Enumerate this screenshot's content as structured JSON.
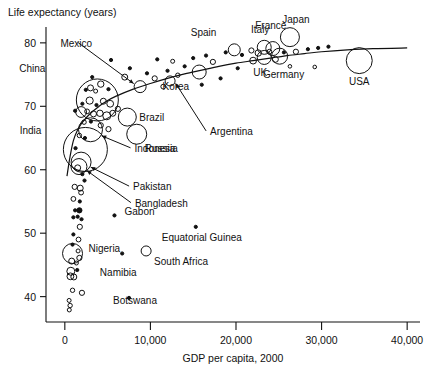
{
  "chart_data": {
    "type": "scatter",
    "title": "Life expectancy (years)",
    "xlabel": "GDP per capita, 2000",
    "ylabel": "Life expectancy (years)",
    "xlim": [
      -2200,
      41500
    ],
    "ylim": [
      36.0,
      82.5
    ],
    "xticks": [
      0,
      10000,
      20000,
      30000,
      40000
    ],
    "xticklabels": [
      "0",
      "10,000",
      "20,000",
      "30,000",
      "40,000"
    ],
    "yticks": [
      40,
      50,
      60,
      70,
      80
    ],
    "yticklabels": [
      "40",
      "50",
      "60",
      "70",
      "80"
    ],
    "grid": false,
    "legend": null,
    "bubble_note": "marker area proportional to population",
    "trend": {
      "name": "fitted-curve",
      "points": [
        [
          250,
          59.0
        ],
        [
          600,
          62.0
        ],
        [
          1000,
          64.6
        ],
        [
          1500,
          66.3
        ],
        [
          2000,
          67.4
        ],
        [
          3000,
          68.9
        ],
        [
          4000,
          70.0
        ],
        [
          5000,
          70.9
        ],
        [
          6000,
          71.6
        ],
        [
          8000,
          72.7
        ],
        [
          10000,
          73.6
        ],
        [
          12000,
          74.4
        ],
        [
          14000,
          75.1
        ],
        [
          16000,
          75.7
        ],
        [
          18000,
          76.3
        ],
        [
          20000,
          76.8
        ],
        [
          22000,
          77.2
        ],
        [
          24000,
          77.6
        ],
        [
          26000,
          78.0
        ],
        [
          28000,
          78.3
        ],
        [
          30000,
          78.6
        ],
        [
          33000,
          78.9
        ],
        [
          36000,
          79.1
        ],
        [
          40000,
          79.2
        ]
      ]
    },
    "labeled_points": [
      {
        "label": "China",
        "x": 3800,
        "y": 71.0,
        "r": 21.0,
        "filled": false,
        "label_dx": -52,
        "label_dy": -28,
        "arrow": false
      },
      {
        "label": "Mexico",
        "x": 8800,
        "y": 73.1,
        "r": 6.0,
        "filled": false,
        "label_dx": -48,
        "label_dy": -40,
        "arrow": true
      },
      {
        "label": "India",
        "x": 2400,
        "y": 63.2,
        "r": 22.0,
        "filled": false,
        "label_dx": -44,
        "label_dy": -15,
        "arrow": false
      },
      {
        "label": "Brazil",
        "x": 7300,
        "y": 68.3,
        "r": 9.0,
        "filled": false,
        "label_dx": 12,
        "label_dy": 4,
        "arrow": false
      },
      {
        "label": "Russia",
        "x": 8400,
        "y": 65.6,
        "r": 10.0,
        "filled": false,
        "label_dx": 8,
        "label_dy": 18,
        "arrow": false
      },
      {
        "label": "Indonesia",
        "x": 3000,
        "y": 66.3,
        "r": 12.0,
        "filled": false,
        "label_dx": 44,
        "label_dy": 22,
        "arrow": true
      },
      {
        "label": "Pakistan",
        "x": 1900,
        "y": 61.2,
        "r": 10.0,
        "filled": false,
        "label_dx": 52,
        "label_dy": 28,
        "arrow": true
      },
      {
        "label": "Bangladesh",
        "x": 1650,
        "y": 60.5,
        "r": 8.0,
        "filled": false,
        "label_dx": 56,
        "label_dy": 40,
        "arrow": true
      },
      {
        "label": "Nigeria",
        "x": 900,
        "y": 46.8,
        "r": 10.0,
        "filled": false,
        "label_dx": 16,
        "label_dy": -2,
        "arrow": false
      },
      {
        "label": "Argentina",
        "x": 12300,
        "y": 74.0,
        "r": 5.0,
        "filled": false,
        "label_dx": 40,
        "label_dy": 54,
        "arrow": true
      },
      {
        "label": "Korea",
        "x": 15700,
        "y": 75.4,
        "r": 7.0,
        "filled": false,
        "label_dx": -10,
        "label_dy": 18,
        "arrow": false
      },
      {
        "label": "Spain",
        "x": 19800,
        "y": 78.9,
        "r": 6.0,
        "filled": false,
        "label_dx": -18,
        "label_dy": -14,
        "arrow": false
      },
      {
        "label": "Italy",
        "x": 23300,
        "y": 79.3,
        "r": 7.0,
        "filled": false,
        "label_dx": -4,
        "label_dy": -14,
        "arrow": false
      },
      {
        "label": "France",
        "x": 24300,
        "y": 79.1,
        "r": 7.0,
        "filled": false,
        "label_dx": -2,
        "label_dy": -20,
        "arrow": false
      },
      {
        "label": "Japan",
        "x": 26300,
        "y": 80.9,
        "r": 9.5,
        "filled": false,
        "label_dx": 6,
        "label_dy": -14,
        "arrow": false
      },
      {
        "label": "UK",
        "x": 23300,
        "y": 77.7,
        "r": 7.0,
        "filled": false,
        "label_dx": -4,
        "label_dy": 18,
        "arrow": false
      },
      {
        "label": "Germany",
        "x": 25100,
        "y": 77.9,
        "r": 8.0,
        "filled": false,
        "label_dx": 4,
        "label_dy": 22,
        "arrow": false
      },
      {
        "label": "USA",
        "x": 34400,
        "y": 77.2,
        "r": 13.0,
        "filled": false,
        "label_dx": 0,
        "label_dy": 24,
        "arrow": false
      },
      {
        "label": "Gabon",
        "x": 5800,
        "y": 52.8,
        "r": 1.6,
        "filled": true,
        "label_dx": 10,
        "label_dy": 0,
        "arrow": false
      },
      {
        "label": "Equatorial Guinea",
        "x": 15300,
        "y": 51.0,
        "r": 1.6,
        "filled": true,
        "label_dx": 6,
        "label_dy": 14,
        "arrow": false
      },
      {
        "label": "South Africa",
        "x": 9500,
        "y": 47.2,
        "r": 5.0,
        "filled": false,
        "label_dx": 8,
        "label_dy": 14,
        "arrow": false
      },
      {
        "label": "Namibia",
        "x": 6700,
        "y": 46.8,
        "r": 1.6,
        "filled": true,
        "label_dx": -4,
        "label_dy": 22,
        "arrow": false
      },
      {
        "label": "Botswana",
        "x": 7500,
        "y": 39.8,
        "r": 1.6,
        "filled": true,
        "label_dx": 6,
        "label_dy": 6,
        "arrow": false
      }
    ],
    "unlabeled_points": [
      {
        "x": 5400,
        "y": 77.3,
        "r": 1.6,
        "filled": true
      },
      {
        "x": 7600,
        "y": 76.0,
        "r": 1.6,
        "filled": true
      },
      {
        "x": 3200,
        "y": 74.6,
        "r": 1.6,
        "filled": true
      },
      {
        "x": 7000,
        "y": 74.6,
        "r": 3.0,
        "filled": false
      },
      {
        "x": 4200,
        "y": 73.5,
        "r": 3.2,
        "filled": false
      },
      {
        "x": 5100,
        "y": 72.7,
        "r": 1.6,
        "filled": true
      },
      {
        "x": 3000,
        "y": 72.9,
        "r": 3.0,
        "filled": false
      },
      {
        "x": 3600,
        "y": 72.4,
        "r": 2.0,
        "filled": false
      },
      {
        "x": 2450,
        "y": 72.6,
        "r": 1.6,
        "filled": true
      },
      {
        "x": 2900,
        "y": 70.9,
        "r": 3.6,
        "filled": false
      },
      {
        "x": 2050,
        "y": 70.4,
        "r": 1.6,
        "filled": true
      },
      {
        "x": 3700,
        "y": 70.2,
        "r": 1.6,
        "filled": true
      },
      {
        "x": 4500,
        "y": 70.8,
        "r": 3.0,
        "filled": false
      },
      {
        "x": 5300,
        "y": 70.4,
        "r": 3.4,
        "filled": false
      },
      {
        "x": 1200,
        "y": 69.3,
        "r": 1.6,
        "filled": true
      },
      {
        "x": 1900,
        "y": 69.1,
        "r": 5.4,
        "filled": false
      },
      {
        "x": 2600,
        "y": 69.2,
        "r": 2.4,
        "filled": false
      },
      {
        "x": 3350,
        "y": 68.8,
        "r": 3.0,
        "filled": false
      },
      {
        "x": 4100,
        "y": 68.9,
        "r": 3.2,
        "filled": false
      },
      {
        "x": 4900,
        "y": 68.5,
        "r": 4.0,
        "filled": false
      },
      {
        "x": 5600,
        "y": 68.9,
        "r": 3.0,
        "filled": false
      },
      {
        "x": 6200,
        "y": 69.6,
        "r": 2.6,
        "filled": false
      },
      {
        "x": 2250,
        "y": 67.5,
        "r": 2.2,
        "filled": false
      },
      {
        "x": 3050,
        "y": 67.6,
        "r": 1.6,
        "filled": true
      },
      {
        "x": 4200,
        "y": 67.0,
        "r": 2.6,
        "filled": false
      },
      {
        "x": 5100,
        "y": 66.4,
        "r": 2.6,
        "filled": false
      },
      {
        "x": 1700,
        "y": 65.4,
        "r": 2.2,
        "filled": false
      },
      {
        "x": 2350,
        "y": 65.0,
        "r": 1.6,
        "filled": true
      },
      {
        "x": 1250,
        "y": 63.4,
        "r": 1.6,
        "filled": true
      },
      {
        "x": 1500,
        "y": 60.3,
        "r": 3.0,
        "filled": false
      },
      {
        "x": 2050,
        "y": 59.3,
        "r": 1.6,
        "filled": true
      },
      {
        "x": 2300,
        "y": 58.3,
        "r": 1.6,
        "filled": true
      },
      {
        "x": 1150,
        "y": 57.3,
        "r": 2.6,
        "filled": false
      },
      {
        "x": 1800,
        "y": 57.1,
        "r": 3.0,
        "filled": false
      },
      {
        "x": 1900,
        "y": 56.4,
        "r": 2.4,
        "filled": false
      },
      {
        "x": 1000,
        "y": 55.4,
        "r": 2.4,
        "filled": false
      },
      {
        "x": 1750,
        "y": 55.0,
        "r": 1.6,
        "filled": true
      },
      {
        "x": 1200,
        "y": 53.6,
        "r": 1.6,
        "filled": true
      },
      {
        "x": 1700,
        "y": 53.6,
        "r": 2.6,
        "filled": true
      },
      {
        "x": 1000,
        "y": 52.5,
        "r": 1.6,
        "filled": true
      },
      {
        "x": 1500,
        "y": 52.6,
        "r": 1.6,
        "filled": true
      },
      {
        "x": 1950,
        "y": 52.2,
        "r": 1.6,
        "filled": true
      },
      {
        "x": 1750,
        "y": 51.0,
        "r": 2.6,
        "filled": false
      },
      {
        "x": 1000,
        "y": 49.8,
        "r": 1.6,
        "filled": true
      },
      {
        "x": 1600,
        "y": 49.0,
        "r": 2.4,
        "filled": false
      },
      {
        "x": 900,
        "y": 48.2,
        "r": 1.6,
        "filled": true
      },
      {
        "x": 1550,
        "y": 47.2,
        "r": 2.0,
        "filled": false
      },
      {
        "x": 1700,
        "y": 46.1,
        "r": 2.6,
        "filled": false
      },
      {
        "x": 800,
        "y": 45.6,
        "r": 3.0,
        "filled": false
      },
      {
        "x": 1350,
        "y": 45.3,
        "r": 2.0,
        "filled": false
      },
      {
        "x": 700,
        "y": 44.0,
        "r": 4.0,
        "filled": false
      },
      {
        "x": 1450,
        "y": 44.2,
        "r": 1.6,
        "filled": true
      },
      {
        "x": 650,
        "y": 43.2,
        "r": 3.4,
        "filled": false
      },
      {
        "x": 1050,
        "y": 43.1,
        "r": 3.0,
        "filled": false
      },
      {
        "x": 900,
        "y": 41.0,
        "r": 2.2,
        "filled": false
      },
      {
        "x": 2000,
        "y": 40.6,
        "r": 2.6,
        "filled": false
      },
      {
        "x": 500,
        "y": 39.4,
        "r": 2.0,
        "filled": false
      },
      {
        "x": 620,
        "y": 38.6,
        "r": 2.2,
        "filled": false
      },
      {
        "x": 520,
        "y": 37.9,
        "r": 2.0,
        "filled": false
      },
      {
        "x": 10500,
        "y": 74.4,
        "r": 2.6,
        "filled": false
      },
      {
        "x": 11500,
        "y": 73.1,
        "r": 2.4,
        "filled": false
      },
      {
        "x": 13200,
        "y": 74.9,
        "r": 2.2,
        "filled": false
      },
      {
        "x": 9600,
        "y": 75.2,
        "r": 1.6,
        "filled": true
      },
      {
        "x": 12000,
        "y": 75.6,
        "r": 1.6,
        "filled": true
      },
      {
        "x": 14000,
        "y": 76.3,
        "r": 1.6,
        "filled": true
      },
      {
        "x": 10800,
        "y": 77.4,
        "r": 1.6,
        "filled": true
      },
      {
        "x": 12600,
        "y": 77.1,
        "r": 2.0,
        "filled": false
      },
      {
        "x": 15000,
        "y": 77.6,
        "r": 1.6,
        "filled": true
      },
      {
        "x": 16500,
        "y": 78.0,
        "r": 1.6,
        "filled": true
      },
      {
        "x": 17300,
        "y": 77.0,
        "r": 2.6,
        "filled": false
      },
      {
        "x": 18800,
        "y": 78.5,
        "r": 1.6,
        "filled": true
      },
      {
        "x": 16000,
        "y": 73.4,
        "r": 1.6,
        "filled": true
      },
      {
        "x": 18200,
        "y": 74.4,
        "r": 1.6,
        "filled": true
      },
      {
        "x": 20700,
        "y": 78.1,
        "r": 1.6,
        "filled": true
      },
      {
        "x": 21800,
        "y": 78.8,
        "r": 2.6,
        "filled": false
      },
      {
        "x": 22600,
        "y": 78.4,
        "r": 3.2,
        "filled": false
      },
      {
        "x": 23900,
        "y": 78.6,
        "r": 2.4,
        "filled": false
      },
      {
        "x": 22000,
        "y": 77.2,
        "r": 3.4,
        "filled": false
      },
      {
        "x": 24600,
        "y": 77.4,
        "r": 3.0,
        "filled": false
      },
      {
        "x": 25600,
        "y": 78.5,
        "r": 1.6,
        "filled": true
      },
      {
        "x": 27000,
        "y": 78.6,
        "r": 2.6,
        "filled": false
      },
      {
        "x": 28400,
        "y": 79.0,
        "r": 1.6,
        "filled": true
      },
      {
        "x": 29600,
        "y": 79.2,
        "r": 1.6,
        "filled": true
      },
      {
        "x": 30800,
        "y": 79.4,
        "r": 1.6,
        "filled": true
      },
      {
        "x": 26300,
        "y": 76.3,
        "r": 1.8,
        "filled": false
      },
      {
        "x": 29200,
        "y": 76.2,
        "r": 1.8,
        "filled": false
      },
      {
        "x": 20200,
        "y": 76.0,
        "r": 1.6,
        "filled": true
      }
    ]
  }
}
